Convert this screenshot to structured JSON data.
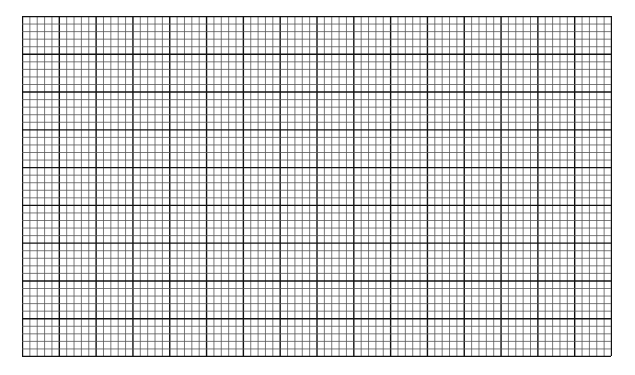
{
  "graph_paper": {
    "left": 22,
    "top": 16,
    "width": 589,
    "height": 340,
    "major_cols": 16,
    "major_rows": 9,
    "minor_per_major": 5,
    "minor_color": "#555555",
    "major_color": "#111111",
    "background": "#ffffff"
  }
}
